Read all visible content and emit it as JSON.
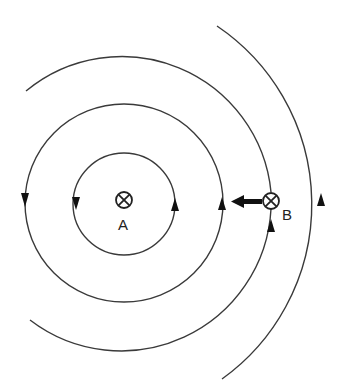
{
  "diagram": {
    "type": "magnetic-field-lines",
    "wires": [
      {
        "id": "A",
        "label": "A",
        "symbol": "⊗",
        "meaning": "current into page"
      },
      {
        "id": "B",
        "label": "B",
        "symbol": "⊗",
        "meaning": "current into page"
      }
    ],
    "field_lines": [
      {
        "name": "inner-circle",
        "around": "A",
        "direction": "counterclockwise-on-screen"
      },
      {
        "name": "middle-circle",
        "around": "A",
        "direction": "counterclockwise-on-screen"
      },
      {
        "name": "outer-arc",
        "around": "A",
        "passes_through": "B"
      },
      {
        "name": "far-right-arc",
        "direction": "upward"
      }
    ],
    "force_arrow": {
      "on": "B",
      "direction": "toward A (left)"
    },
    "colors": {
      "line": "#3a3a3a",
      "arrow": "#111111",
      "background": "#ffffff"
    }
  }
}
